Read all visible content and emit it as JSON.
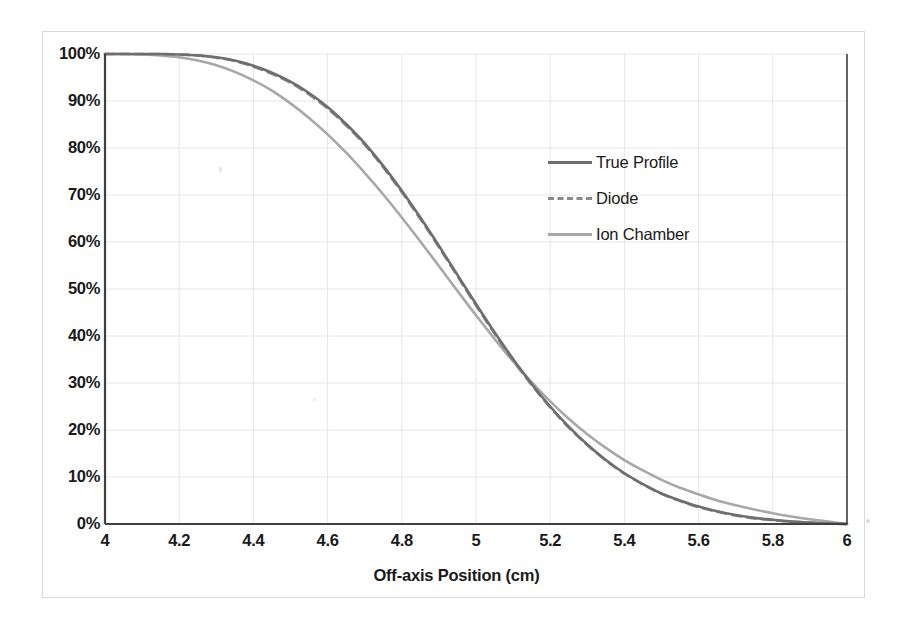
{
  "chart_data": {
    "type": "line",
    "title": "",
    "subtitle": "",
    "xlabel": "Off-axis Position (cm)",
    "ylabel": "",
    "xlim": [
      4,
      6
    ],
    "ylim": [
      0,
      100
    ],
    "grid": true,
    "legend_position": "inside-upper-right",
    "xticks": [
      "4",
      "4.2",
      "4.4",
      "4.6",
      "4.8",
      "5",
      "5.2",
      "5.4",
      "5.6",
      "5.8",
      "6"
    ],
    "xtick_values": [
      4,
      4.2,
      4.4,
      4.6,
      4.8,
      5,
      5.2,
      5.4,
      5.6,
      5.8,
      6
    ],
    "yticks": [
      "0%",
      "10%",
      "20%",
      "30%",
      "40%",
      "50%",
      "60%",
      "70%",
      "80%",
      "90%",
      "100%"
    ],
    "ytick_values": [
      0,
      10,
      20,
      30,
      40,
      50,
      60,
      70,
      80,
      90,
      100
    ],
    "x": [
      4.0,
      4.05,
      4.1,
      4.15,
      4.2,
      4.25,
      4.3,
      4.35,
      4.4,
      4.45,
      4.5,
      4.55,
      4.6,
      4.65,
      4.7,
      4.75,
      4.8,
      4.85,
      4.9,
      4.95,
      5.0,
      5.05,
      5.1,
      5.15,
      5.2,
      5.25,
      5.3,
      5.35,
      5.4,
      5.45,
      5.5,
      5.55,
      5.6,
      5.65,
      5.7,
      5.75,
      5.8,
      5.85,
      5.9,
      5.95,
      6.0
    ],
    "series": [
      {
        "name": "True Profile",
        "color": "#6e6e6e",
        "style": "solid",
        "width": 2.6,
        "values": [
          100,
          100,
          100,
          100,
          99.9,
          99.7,
          99.3,
          98.6,
          97.5,
          96.0,
          94.1,
          91.7,
          88.7,
          85.1,
          81.0,
          76.2,
          70.9,
          65.2,
          59.2,
          53.0,
          46.8,
          40.8,
          35.1,
          29.8,
          25.0,
          20.7,
          16.9,
          13.6,
          10.8,
          8.5,
          6.5,
          5.0,
          3.7,
          2.7,
          1.9,
          1.3,
          0.9,
          0.5,
          0.3,
          0.1,
          0.0
        ]
      },
      {
        "name": "Diode",
        "color": "#8a8a8a",
        "style": "dashed",
        "width": 2.6,
        "values": [
          100,
          100,
          100,
          100,
          99.9,
          99.7,
          99.2,
          98.5,
          97.3,
          95.8,
          93.9,
          91.4,
          88.4,
          84.8,
          80.7,
          75.9,
          70.6,
          64.9,
          58.9,
          52.7,
          46.5,
          40.5,
          34.8,
          29.6,
          24.8,
          20.5,
          16.8,
          13.5,
          10.7,
          8.4,
          6.4,
          4.9,
          3.6,
          2.6,
          1.8,
          1.2,
          0.8,
          0.5,
          0.3,
          0.1,
          0.0
        ]
      },
      {
        "name": "Ion Chamber",
        "color": "#a8a8a8",
        "style": "solid",
        "width": 2.6,
        "values": [
          100,
          100,
          99.9,
          99.7,
          99.3,
          98.6,
          97.6,
          96.2,
          94.4,
          92.2,
          89.5,
          86.4,
          82.9,
          79.0,
          74.7,
          70.1,
          65.2,
          60.1,
          54.9,
          49.6,
          44.4,
          39.4,
          34.6,
          30.2,
          26.1,
          22.4,
          19.1,
          16.2,
          13.6,
          11.4,
          9.4,
          7.7,
          6.3,
          5.0,
          4.0,
          3.1,
          2.3,
          1.6,
          1.0,
          0.5,
          0.0
        ]
      }
    ],
    "legend": [
      {
        "label": "True Profile",
        "color": "#6e6e6e",
        "style": "solid"
      },
      {
        "label": "Diode",
        "color": "#8a8a8a",
        "style": "dashed"
      },
      {
        "label": "Ion Chamber",
        "color": "#a8a8a8",
        "style": "solid"
      }
    ]
  },
  "style": {
    "axis_color": "#444444",
    "grid_color": "#e6e6e6",
    "text_color": "#1a1a1a",
    "background": "#ffffff",
    "border_color": "#d9d9d9"
  }
}
